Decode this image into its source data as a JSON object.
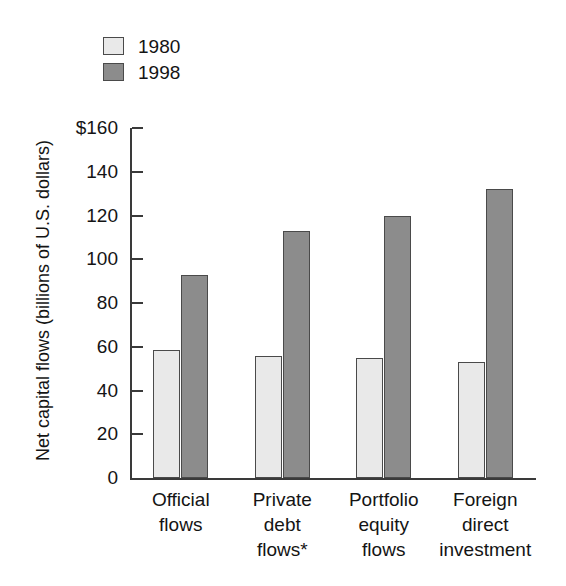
{
  "chart_data": {
    "type": "bar",
    "title": "",
    "subtitle": "",
    "xlabel": "",
    "ylabel": "Net capital flows (billions of U.S. dollars)",
    "ylim": [
      0,
      160
    ],
    "ytick_values": [
      0,
      20,
      40,
      60,
      80,
      100,
      120,
      140,
      160
    ],
    "ytick_labels": [
      "0",
      "20",
      "40",
      "60",
      "80",
      "100",
      "120",
      "140",
      "$160"
    ],
    "grid": false,
    "legend_position": "top-left",
    "categories": [
      "Official flows",
      "Private debt flows*",
      "Portfolio equity flows",
      "Foreign direct investment"
    ],
    "category_lines": [
      [
        "Official",
        "flows"
      ],
      [
        "Private",
        "debt",
        "flows*"
      ],
      [
        "Portfolio",
        "equity",
        "flows"
      ],
      [
        "Foreign",
        "direct",
        "investment"
      ]
    ],
    "series": [
      {
        "name": "1980",
        "color": "#e9e9e9",
        "values": [
          58.5,
          56,
          55,
          53
        ]
      },
      {
        "name": "1998",
        "color": "#8c8c8c",
        "values": [
          93,
          113,
          120,
          132
        ]
      }
    ],
    "annotations": [
      "*"
    ],
    "axis_color": "#3a3a3a"
  },
  "legend": {
    "items": [
      {
        "label": "1980",
        "swatch": "legend-swatch-1980"
      },
      {
        "label": "1998",
        "swatch": "legend-swatch-1998"
      }
    ]
  },
  "axis": {
    "y_title": "Net capital flows (billions of U.S. dollars)"
  }
}
